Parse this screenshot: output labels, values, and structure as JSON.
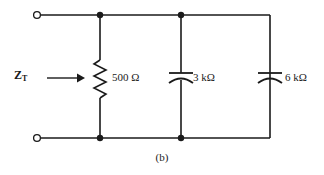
{
  "figure": {
    "caption": "(b)",
    "impedance_label": {
      "symbol": "Z",
      "subscript": "T"
    }
  },
  "components": [
    {
      "id": "r1",
      "type": "resistor",
      "label": "500 Ω",
      "value": 500,
      "unit": "Ω"
    },
    {
      "id": "c1",
      "type": "capacitor",
      "label": "3 kΩ",
      "value": 3,
      "unit": "kΩ"
    },
    {
      "id": "c2",
      "type": "capacitor",
      "label": "6 kΩ",
      "value": 6,
      "unit": "kΩ"
    }
  ],
  "colors": {
    "wire": "#1a1a1a",
    "background": "#ffffff",
    "text": "#1a1a1a"
  }
}
